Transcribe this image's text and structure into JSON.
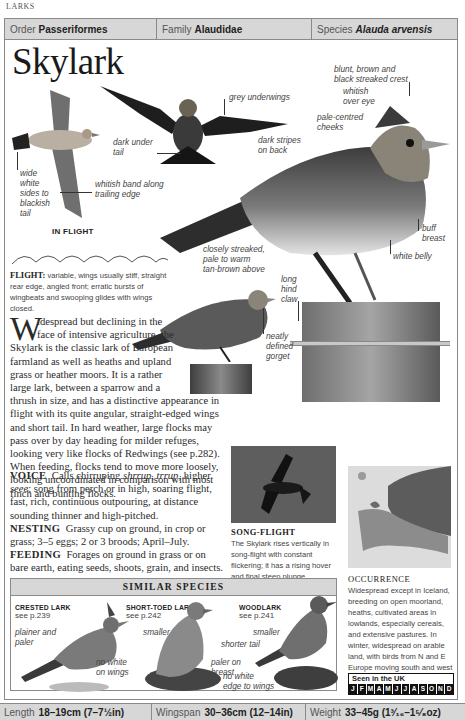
{
  "section_label": "LARKS",
  "taxonomy": {
    "order_label": "Order",
    "order_value": "Passeriformes",
    "family_label": "Family",
    "family_value": "Alaudidae",
    "species_label": "Species",
    "species_value": "Alauda arvensis"
  },
  "title": "Skylark",
  "annotations": {
    "wide_white_sides": [
      "wide",
      "white",
      "sides to",
      "blackish",
      "tail"
    ],
    "whitish_band": [
      "whitish band along",
      "trailing edge"
    ],
    "dark_under_tail": [
      "dark under",
      "tail"
    ],
    "grey_underwings": "grey underwings",
    "crest": [
      "blunt, brown and",
      "black streaked crest"
    ],
    "whitish_over_eye": [
      "whitish",
      "over eye"
    ],
    "pale_cheeks": [
      "pale-centred",
      "cheeks"
    ],
    "dark_stripes": [
      "dark stripes",
      "on back"
    ],
    "buff_breast": [
      "buff",
      "breast"
    ],
    "white_belly": "white belly",
    "closely_streaked": [
      "closely streaked,",
      "pale to warm",
      "tan-brown above"
    ],
    "hind_claw": [
      "long",
      "hind",
      "claw"
    ],
    "gorget": [
      "neatly",
      "defined",
      "gorget"
    ]
  },
  "in_flight_caption": "IN FLIGHT",
  "flight": {
    "label": "FLIGHT:",
    "text": "variable, wings usually stiff, straight rear edge, angled front; erratic bursts of wingbeats and swooping glides with wings closed."
  },
  "body": {
    "dropcap": "W",
    "intro": "idespread but declining in the face of intensive agriculture, the Skylark is the classic lark of European farmland as well as heaths and upland grass or heather moors. It is a rather large lark, between a sparrow and a thrush in size, and has a distinctive appearance in flight with its quite angular, straight-edged wings and short tail. In hard weather, large flocks may pass over by day heading for milder refuges, looking very like flocks of Redwings (see p.282). When feeding, flocks tend to move more loosely, looking uncoordinated in comparison with most finch and bunting flocks.",
    "voice_label": "VOICE",
    "voice_text_1": "Calls chirruping",
    "voice_call_1": "shrrup",
    "voice_call_2": "trrup",
    "voice_text_2": ", higher",
    "voice_call_3": "seee",
    "voice_text_3": "; song from perch or in high, soaring flight, fast, rich, continuous outpouring, at distance sounding thinner and high-pitched.",
    "nesting_label": "NESTING",
    "nesting_text": "Grassy cup on ground, in crop or grass; 3–5 eggs; 2 or 3 broods; April–July.",
    "feeding_label": "FEEDING",
    "feeding_text": "Forages on ground in grass or on bare earth, eating seeds, shoots, grain, and insects."
  },
  "song_flight": {
    "title": "SONG-FLIGHT",
    "text": "The Skylark rises vertically in song-flight with constant flickering; it has a rising hover and final steep plunge."
  },
  "occurrence": {
    "title": "OCCURRENCE",
    "text": "Widespread except in Iceland, breeding on open moorland, heaths, cultivated areas in lowlands, especially cereals, and extensive pastures. In winter, widespread on arable land, with birds from N and E Europe moving south and west in sizeable flocks.",
    "seen_label": "Seen in the UK",
    "months": [
      "J",
      "F",
      "M",
      "A",
      "M",
      "J",
      "J",
      "A",
      "S",
      "O",
      "N",
      "D"
    ]
  },
  "similar_species": {
    "title": "SIMILAR SPECIES",
    "items": [
      {
        "name": "CRESTED LARK",
        "ref": "see p.239",
        "notes": [
          [
            "plainer and",
            "paler"
          ],
          [
            "no white",
            "on wings"
          ]
        ]
      },
      {
        "name": "SHORT-TOED LARK",
        "ref": "see p.242",
        "notes": [
          [
            "smaller"
          ],
          [
            "paler on",
            "breast"
          ]
        ]
      },
      {
        "name": "WOODLARK",
        "ref": "see p.241",
        "notes": [
          [
            "smaller"
          ],
          [
            "shorter tail"
          ],
          [
            "no white",
            "edge to wings"
          ]
        ]
      }
    ]
  },
  "footer": {
    "length_label": "Length",
    "length_value": "18–19cm (7–7½in)",
    "wingspan_label": "Wingspan",
    "wingspan_value": "30–36cm (12–14in)",
    "weight_label": "Weight",
    "weight_value": "33–45g (1³⁄₁₆–1⁵⁄₈oz)"
  }
}
